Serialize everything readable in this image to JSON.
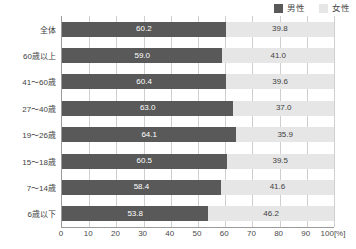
{
  "legend": {
    "position": "top-right",
    "entries": [
      {
        "label": "男性",
        "color": "#595959",
        "icon": "legend-swatch-icon"
      },
      {
        "label": "女性",
        "color": "#e6e6e6",
        "icon": "legend-swatch-icon"
      }
    ]
  },
  "axis": {
    "x_unit_label": "100[%]",
    "ticks": [
      "0",
      "10",
      "20",
      "30",
      "40",
      "50",
      "60",
      "70",
      "80",
      "90",
      "100[%]"
    ],
    "tick_values": [
      0,
      10,
      20,
      30,
      40,
      50,
      60,
      70,
      80,
      90,
      100
    ],
    "xlim": [
      0,
      100
    ]
  },
  "chart_data": {
    "type": "bar",
    "orientation": "horizontal",
    "stacked": true,
    "stack_total": 100,
    "title": "",
    "subtitle": "",
    "xlabel": "100[%]",
    "ylabel": "",
    "xlim": [
      0,
      100
    ],
    "grid": true,
    "legend_position": "top-right",
    "categories": [
      "全体",
      "60歳以上",
      "41～60歳",
      "27～40歳",
      "19～26歳",
      "15～18歳",
      "7～14歳",
      "6歳以下"
    ],
    "series": [
      {
        "name": "男性",
        "color": "#595959",
        "values": [
          60.2,
          59.0,
          60.4,
          63.0,
          64.1,
          60.5,
          58.4,
          53.8
        ],
        "labels": [
          "60.2",
          "59.0",
          "60.4",
          "63.0",
          "64.1",
          "60.5",
          "58.4",
          "53.8"
        ]
      },
      {
        "name": "女性",
        "color": "#e6e6e6",
        "values": [
          39.8,
          41.0,
          39.6,
          37.0,
          35.9,
          39.5,
          41.6,
          46.2
        ],
        "labels": [
          "39.8",
          "41.0",
          "39.6",
          "37.0",
          "35.9",
          "39.5",
          "41.6",
          "46.2"
        ]
      }
    ]
  }
}
